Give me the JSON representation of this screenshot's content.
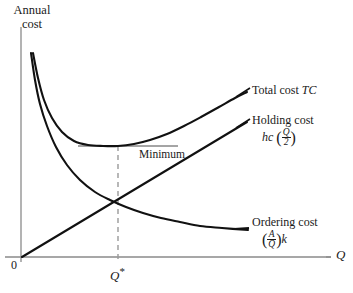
{
  "chart_data": {
    "type": "line",
    "title": "",
    "xlabel": "Q",
    "ylabel_line1": "Annual",
    "ylabel_line2": "cost",
    "grid": false,
    "legend_position": "right-inline",
    "origin_label": "0",
    "xticks": [
      {
        "label": "Q*",
        "value": 118
      }
    ],
    "annotations": [
      {
        "name": "minimum",
        "label": "Minimum"
      },
      {
        "name": "optimal-quantity",
        "label": "Q*"
      }
    ],
    "series": [
      {
        "name": "Total cost TC",
        "label": "Total cost",
        "symbol": "TC",
        "formula": "",
        "type": "u-curve",
        "points": [
          [
            33,
            53
          ],
          [
            38,
            78
          ],
          [
            44,
            100
          ],
          [
            52,
            118
          ],
          [
            62,
            132
          ],
          [
            74,
            141
          ],
          [
            88,
            145
          ],
          [
            103,
            146
          ],
          [
            118,
            146
          ],
          [
            134,
            144
          ],
          [
            150,
            140
          ],
          [
            167,
            134
          ],
          [
            184,
            126
          ],
          [
            201,
            117
          ],
          [
            219,
            107
          ],
          [
            235,
            98
          ],
          [
            247,
            92
          ]
        ]
      },
      {
        "name": "Holding cost",
        "label": "Holding cost",
        "formula_numerator": "Q",
        "formula_denominator": "2",
        "formula_prefix": "hc",
        "type": "linear",
        "points": [
          [
            22,
            257
          ],
          [
            247,
            122
          ]
        ]
      },
      {
        "name": "Ordering cost",
        "label": "Ordering cost",
        "formula_numerator": "A",
        "formula_denominator": "Q",
        "formula_suffix": "k",
        "type": "hyperbola",
        "points": [
          [
            31,
            53
          ],
          [
            35,
            80
          ],
          [
            40,
            104
          ],
          [
            47,
            126
          ],
          [
            56,
            147
          ],
          [
            67,
            165
          ],
          [
            80,
            180
          ],
          [
            95,
            192
          ],
          [
            110,
            200
          ],
          [
            126,
            207
          ],
          [
            143,
            213
          ],
          [
            161,
            218
          ],
          [
            180,
            222
          ],
          [
            200,
            226
          ],
          [
            222,
            228
          ],
          [
            248,
            230
          ]
        ]
      }
    ],
    "colors": {
      "curve": "#111111",
      "axis": "#8a8a8a",
      "dashed": "#9a9a9a",
      "minimum_line": "#4a4a4a",
      "background": "#ffffff",
      "text": "#1a1a1a"
    },
    "axes": {
      "y_axis": {
        "x": 21,
        "y_top": 27,
        "y_bottom": 262
      },
      "x_axis": {
        "y": 257,
        "x_left": 5,
        "x_right": 331
      }
    },
    "minimum_line": {
      "x_start": 78,
      "x_end": 178,
      "y": 146
    },
    "qstar_line": {
      "x": 118,
      "y_top": 146,
      "y_bottom": 262
    }
  }
}
